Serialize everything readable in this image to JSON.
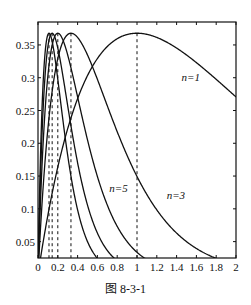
{
  "chart_data": {
    "type": "line",
    "title": "",
    "caption": "图 8-3-1",
    "xlabel": "",
    "ylabel": "",
    "function": "y = n x e^(-n x)",
    "xlim": [
      0,
      2
    ],
    "ylim": [
      0.025,
      0.385
    ],
    "grid": false,
    "legend": "inline labels",
    "x_ticks": [
      0,
      0.2,
      0.4,
      0.6,
      0.8,
      1,
      1.2,
      1.4,
      1.6,
      1.8,
      2
    ],
    "x_tick_labels": [
      "0",
      "0.2",
      "0.4",
      "0.6",
      "0.8",
      "1",
      "1.2",
      "1.4",
      "1.6",
      "1.8",
      "2"
    ],
    "y_ticks": [
      0.05,
      0.1,
      0.15,
      0.2,
      0.25,
      0.3,
      0.35
    ],
    "y_tick_labels": [
      "0.05",
      "0.1",
      "0.15",
      "0.2",
      "0.25",
      "0.3",
      "0.35"
    ],
    "series": [
      {
        "name": "n=1",
        "n": 1,
        "peak_x": 1.0,
        "peak_y": 0.3679,
        "label": "n=1",
        "label_pos": [
          1.45,
          0.295
        ],
        "x": [
          0,
          0.2,
          0.4,
          0.6,
          0.8,
          1.0,
          1.2,
          1.4,
          1.6,
          1.8,
          2.0
        ],
        "values": [
          0,
          0.164,
          0.268,
          0.329,
          0.359,
          0.368,
          0.361,
          0.345,
          0.323,
          0.298,
          0.271
        ]
      },
      {
        "name": "n=3",
        "n": 3,
        "peak_x": 0.333,
        "peak_y": 0.3679,
        "label": "n=3",
        "label_pos": [
          1.3,
          0.115
        ],
        "x": [
          0,
          0.2,
          0.4,
          0.6,
          0.8,
          1.0,
          1.2,
          1.4,
          1.6,
          1.8,
          2.0
        ],
        "values": [
          0,
          0.329,
          0.361,
          0.298,
          0.218,
          0.149,
          0.098,
          0.063,
          0.039,
          0.024,
          0.015
        ]
      },
      {
        "name": "n=5",
        "n": 5,
        "peak_x": 0.2,
        "peak_y": 0.3679,
        "label": "n=5",
        "label_pos": [
          0.72,
          0.125
        ],
        "x": [
          0,
          0.2,
          0.4,
          0.6,
          0.8,
          1.0,
          1.2
        ],
        "values": [
          0,
          0.368,
          0.271,
          0.149,
          0.073,
          0.034,
          0.015
        ]
      },
      {
        "name": "n=7",
        "n": 7,
        "peak_x": 0.143,
        "peak_y": 0.3679,
        "label": "",
        "x": [
          0,
          0.143,
          0.2,
          0.4,
          0.6,
          0.8
        ],
        "values": [
          0,
          0.368,
          0.345,
          0.17,
          0.063,
          0.021
        ]
      },
      {
        "name": "n=9",
        "n": 9,
        "peak_x": 0.111,
        "peak_y": 0.3679,
        "label": "",
        "x": [
          0,
          0.111,
          0.2,
          0.4,
          0.6
        ],
        "values": [
          0,
          0.368,
          0.298,
          0.098,
          0.024
        ]
      }
    ],
    "dashed_lines_x": [
      1.0,
      0.333,
      0.2,
      0.143,
      0.111
    ]
  },
  "colors": {
    "line": "#111111",
    "background": "#ffffff"
  }
}
